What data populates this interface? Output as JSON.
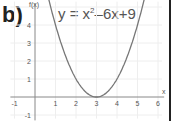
{
  "label": "b)",
  "equation": {
    "prefix": "y = x",
    "exp": "2",
    "suffix": "–6x+9"
  },
  "chart_data": {
    "type": "line",
    "xlabel": "x",
    "ylabel": "f(x)",
    "xlim": [
      -1.2,
      6.2
    ],
    "ylim": [
      -1.2,
      5.2
    ],
    "x_ticks": [
      -1,
      1,
      2,
      3,
      4,
      5,
      6
    ],
    "y_ticks": [
      -1,
      1,
      2,
      3,
      4
    ],
    "grid": true,
    "series": [
      {
        "name": "y = x^2 - 6x + 9",
        "x": [
          0.7,
          1,
          1.5,
          2,
          2.5,
          3,
          3.5,
          4,
          4.5,
          5,
          5.3
        ],
        "y": [
          5.29,
          4,
          2.25,
          1,
          0.25,
          0,
          0.25,
          1,
          2.25,
          4,
          5.29
        ]
      }
    ]
  },
  "colors": {
    "curve": "#777777",
    "axis": "#888888",
    "grid": "#eeeeee",
    "text": "#555555"
  }
}
